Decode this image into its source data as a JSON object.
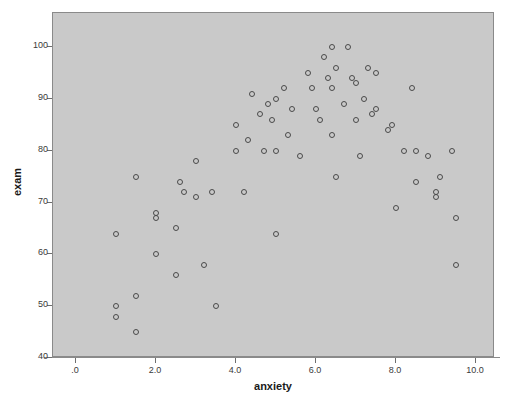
{
  "chart_data": {
    "type": "scatter",
    "title": "",
    "xlabel": "anxiety",
    "ylabel": "exam",
    "xlim": [
      -0.6,
      10.6
    ],
    "ylim": [
      40,
      103
    ],
    "grid": false,
    "legend": null,
    "xticks": [
      ".0",
      "2.0",
      "4.0",
      "6.0",
      "8.0",
      "10.0"
    ],
    "xtick_values": [
      0,
      2,
      4,
      6,
      8,
      10
    ],
    "yticks": [
      "40",
      "50",
      "60",
      "70",
      "80",
      "90",
      "100"
    ],
    "ytick_values": [
      40,
      50,
      60,
      70,
      80,
      90,
      100
    ],
    "marker": "open-circle",
    "marker_color": "#4a4a4a",
    "plot_background": "#c9c9c9",
    "figure_background": "#ffffff",
    "points": [
      {
        "x": 1.0,
        "y": 64
      },
      {
        "x": 1.0,
        "y": 50
      },
      {
        "x": 1.0,
        "y": 48
      },
      {
        "x": 1.5,
        "y": 75
      },
      {
        "x": 1.5,
        "y": 52
      },
      {
        "x": 1.5,
        "y": 45
      },
      {
        "x": 2.0,
        "y": 68
      },
      {
        "x": 2.0,
        "y": 67
      },
      {
        "x": 2.0,
        "y": 60
      },
      {
        "x": 2.5,
        "y": 65
      },
      {
        "x": 2.5,
        "y": 56
      },
      {
        "x": 2.6,
        "y": 74
      },
      {
        "x": 2.7,
        "y": 72
      },
      {
        "x": 3.0,
        "y": 78
      },
      {
        "x": 3.0,
        "y": 71
      },
      {
        "x": 3.2,
        "y": 58
      },
      {
        "x": 3.4,
        "y": 72
      },
      {
        "x": 3.5,
        "y": 50
      },
      {
        "x": 4.0,
        "y": 80
      },
      {
        "x": 4.0,
        "y": 85
      },
      {
        "x": 4.2,
        "y": 72
      },
      {
        "x": 4.3,
        "y": 82
      },
      {
        "x": 4.4,
        "y": 91
      },
      {
        "x": 4.6,
        "y": 87
      },
      {
        "x": 4.7,
        "y": 80
      },
      {
        "x": 4.8,
        "y": 89
      },
      {
        "x": 4.9,
        "y": 86
      },
      {
        "x": 5.0,
        "y": 90
      },
      {
        "x": 5.0,
        "y": 80
      },
      {
        "x": 5.0,
        "y": 64
      },
      {
        "x": 5.2,
        "y": 92
      },
      {
        "x": 5.3,
        "y": 83
      },
      {
        "x": 5.4,
        "y": 88
      },
      {
        "x": 5.6,
        "y": 79
      },
      {
        "x": 5.8,
        "y": 95
      },
      {
        "x": 5.9,
        "y": 92
      },
      {
        "x": 6.0,
        "y": 88
      },
      {
        "x": 6.1,
        "y": 86
      },
      {
        "x": 6.2,
        "y": 98
      },
      {
        "x": 6.3,
        "y": 94
      },
      {
        "x": 6.4,
        "y": 100
      },
      {
        "x": 6.4,
        "y": 92
      },
      {
        "x": 6.4,
        "y": 83
      },
      {
        "x": 6.5,
        "y": 96
      },
      {
        "x": 6.5,
        "y": 75
      },
      {
        "x": 6.7,
        "y": 89
      },
      {
        "x": 6.8,
        "y": 100
      },
      {
        "x": 6.9,
        "y": 94
      },
      {
        "x": 7.0,
        "y": 93
      },
      {
        "x": 7.0,
        "y": 86
      },
      {
        "x": 7.1,
        "y": 79
      },
      {
        "x": 7.2,
        "y": 90
      },
      {
        "x": 7.3,
        "y": 96
      },
      {
        "x": 7.4,
        "y": 87
      },
      {
        "x": 7.5,
        "y": 95
      },
      {
        "x": 7.5,
        "y": 88
      },
      {
        "x": 7.8,
        "y": 84
      },
      {
        "x": 7.9,
        "y": 85
      },
      {
        "x": 8.0,
        "y": 69
      },
      {
        "x": 8.2,
        "y": 80
      },
      {
        "x": 8.4,
        "y": 92
      },
      {
        "x": 8.5,
        "y": 80
      },
      {
        "x": 8.5,
        "y": 74
      },
      {
        "x": 8.8,
        "y": 79
      },
      {
        "x": 9.0,
        "y": 72
      },
      {
        "x": 9.0,
        "y": 71
      },
      {
        "x": 9.1,
        "y": 75
      },
      {
        "x": 9.4,
        "y": 80
      },
      {
        "x": 9.5,
        "y": 67
      },
      {
        "x": 9.5,
        "y": 58
      }
    ]
  }
}
